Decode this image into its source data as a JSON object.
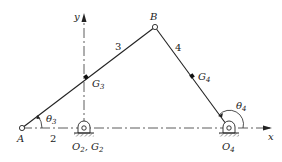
{
  "diagram": {
    "type": "four-bar linkage",
    "colors": {
      "line": "#222222",
      "background": "#ffffff",
      "ground_hatch": "#555555"
    },
    "axes": {
      "x_label": "x",
      "y_label": "y"
    },
    "points": {
      "A": {
        "label": "A"
      },
      "B": {
        "label": "B"
      },
      "O2G2": {
        "label_main": "O",
        "sub1": "2",
        "sep": ", G",
        "sub2": "2"
      },
      "O4": {
        "label_main": "O",
        "sub": "4"
      },
      "G3": {
        "label_main": "G",
        "sub": "3"
      },
      "G4": {
        "label_main": "G",
        "sub": "4"
      }
    },
    "links": {
      "link2": "2",
      "link3": "3",
      "link4": "4"
    },
    "angles": {
      "theta3": {
        "main": "θ",
        "sub": "3"
      },
      "theta4": {
        "main": "θ",
        "sub": "4"
      }
    }
  }
}
